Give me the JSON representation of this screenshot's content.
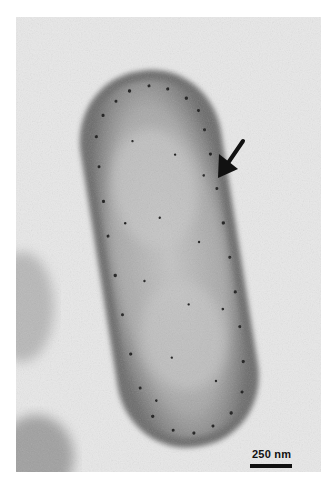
{
  "figure": {
    "type": "transmission electron micrograph",
    "scale_bar": {
      "label": "250 nm",
      "color": "#111111"
    },
    "annotation": {
      "type": "arrow",
      "icon": "arrow-pointer-icon",
      "color": "#111111"
    },
    "colors": {
      "background": "#e6e6e6",
      "cell_body": "#b4b4b4",
      "cell_edge": "#6e6e6e",
      "page": "#ffffff"
    }
  }
}
